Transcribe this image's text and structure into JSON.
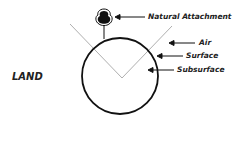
{
  "diagram": {
    "region_label": "LAND",
    "labels": [
      {
        "text": "Natural Attachment",
        "target": "tree"
      },
      {
        "text": "Air",
        "target": "above-surface"
      },
      {
        "text": "Surface",
        "target": "circle-edge"
      },
      {
        "text": "Subsurface",
        "target": "circle-interior"
      }
    ],
    "colors": {
      "stroke": "#111111",
      "guide": "#999999",
      "text": "#222222"
    }
  }
}
